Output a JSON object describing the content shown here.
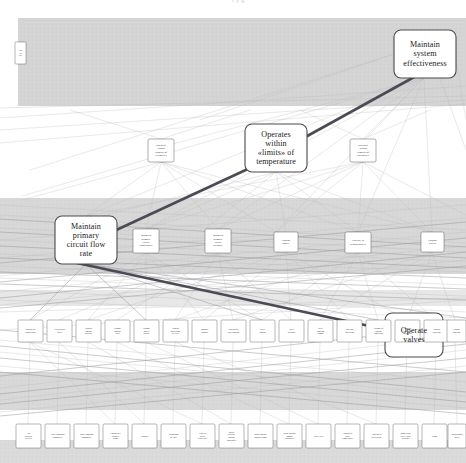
{
  "header": {
    "clipped_text": "t                    y                    g"
  },
  "diagram": {
    "title_visible": false,
    "colors": {
      "band_fill": "#d2d2d2",
      "node_fill": "#ffffff",
      "node_stroke": "#4a4a4a",
      "edge_faint": "#b9b9bd",
      "edge_mid": "#8d8d92",
      "highlight_edge": "#4b4b55",
      "text": "#1a1a1a",
      "background": "#ffffff"
    },
    "bands": [
      {
        "name": "band-top",
        "y": 18,
        "height": 88
      },
      {
        "name": "band-second",
        "y": 198,
        "height": 76
      },
      {
        "name": "band-third",
        "y": 290,
        "height": 16
      },
      {
        "name": "band-fourth",
        "y": 372,
        "height": 38
      },
      {
        "name": "band-bottom",
        "y": 440,
        "height": 23
      }
    ],
    "highlight_path": [
      "maintain-system-effectiveness",
      "operates-within-limits-of-temperature",
      "maintain-primary-circuit-flow-rate",
      "operate-valves"
    ],
    "major_nodes": [
      {
        "id": "maintain-system-effectiveness",
        "label": "Maintain system effectiveness",
        "lines": [
          "Maintain",
          "system",
          "effectiveness"
        ],
        "x": 394,
        "y": 30,
        "w": 62,
        "h": 48,
        "tier": "major"
      },
      {
        "id": "operates-within-limits-of-temperature",
        "label": "Operates within «limits» of temperature",
        "lines": [
          "Operates",
          "within",
          "«limits» of",
          "temperature"
        ],
        "x": 245,
        "y": 124,
        "w": 62,
        "h": 48,
        "tier": "major"
      },
      {
        "id": "maintain-primary-circuit-flow-rate",
        "label": "Maintain primary circuit flow rate",
        "lines": [
          "Maintain",
          "primary",
          "circuit flow",
          "rate"
        ],
        "x": 55,
        "y": 216,
        "w": 62,
        "h": 48,
        "tier": "major"
      },
      {
        "id": "operate-valves",
        "label": "Operate valves",
        "lines": [
          "Operate",
          "valves"
        ],
        "x": 385,
        "y": 313,
        "w": 58,
        "h": 44,
        "tier": "major"
      }
    ],
    "edge_nodes": [
      {
        "id": "left-edge-clipped-node",
        "label": "Ma int ain",
        "lines": [
          "Ma",
          "int",
          "ain"
        ],
        "x": 15,
        "y": 42,
        "w": 11,
        "h": 22,
        "tier": "tiny"
      }
    ],
    "tier2_nodes": [
      {
        "id": "t2-limits-left",
        "label": "Operates within «limits» of «velocity»",
        "lines": [
          "Operates",
          "within",
          "«limits» of",
          "«velocity»"
        ],
        "x": 148,
        "y": 139,
        "w": 26,
        "h": 23,
        "tier": "mid"
      },
      {
        "id": "t2-limits-right",
        "label": "Operates within «limits» of «pressure»",
        "lines": [
          "Operates",
          "within",
          "«limits» of",
          "«pressure»"
        ],
        "x": 350,
        "y": 139,
        "w": 26,
        "h": 23,
        "tier": "mid"
      }
    ],
    "tier3_nodes": [
      {
        "id": "t3-maintain-primary-circuit-temperature",
        "label": "Maintain primary circuit temperature",
        "lines": [
          "Maintain",
          "primary",
          "circuit",
          "temperature"
        ],
        "x": 133,
        "y": 229,
        "w": 26,
        "h": 24,
        "tier": "mid"
      },
      {
        "id": "t3-maintain-primary-circuit-pressure",
        "label": "Maintain primary circuit pressure",
        "lines": [
          "Maintain",
          "primary",
          "circuit",
          "pressure"
        ],
        "x": 205,
        "y": 229,
        "w": 26,
        "h": 24,
        "tier": "mid"
      },
      {
        "id": "t3-control-power",
        "label": "Control power",
        "lines": [
          "Control",
          "power"
        ],
        "x": 274,
        "y": 232,
        "w": 24,
        "h": 20,
        "tier": "mid"
      },
      {
        "id": "t3-operate-in-temperature",
        "label": "Operate in «temperature»",
        "lines": [
          "Operate in",
          "«temperature»"
        ],
        "x": 345,
        "y": 232,
        "w": 26,
        "h": 21,
        "tier": "mid"
      },
      {
        "id": "t3-control-valves",
        "label": "Control valves",
        "lines": [
          "Control",
          "valves"
        ],
        "x": 421,
        "y": 232,
        "w": 23,
        "h": 20,
        "tier": "mid"
      }
    ],
    "tier4_nodes": [
      {
        "id": "t4-01",
        "label": "Control the temperature",
        "lines": [
          "Control the",
          "temperature"
        ],
        "x": 18,
        "y": 320,
        "w": 25,
        "h": 22
      },
      {
        "id": "t4-02",
        "label": "Circulating water",
        "lines": [
          "Circulating",
          "water"
        ],
        "x": 47,
        "y": 320,
        "w": 25,
        "h": 22
      },
      {
        "id": "t4-03",
        "label": "Control coolant pressure",
        "lines": [
          "Control",
          "coolant",
          "pressure"
        ],
        "x": 76,
        "y": 320,
        "w": 25,
        "h": 22
      },
      {
        "id": "t4-04",
        "label": "Change coolant flow",
        "lines": [
          "Change",
          "coolant",
          "flow"
        ],
        "x": 105,
        "y": 320,
        "w": 25,
        "h": 22
      },
      {
        "id": "t4-05",
        "label": "Change power output",
        "lines": [
          "Change",
          "power",
          "output"
        ],
        "x": 134,
        "y": 320,
        "w": 25,
        "h": 22
      },
      {
        "id": "t4-06",
        "label": "Control measuring devices",
        "lines": [
          "Control",
          "measuring",
          "devices"
        ],
        "x": 163,
        "y": 320,
        "w": 25,
        "h": 22
      },
      {
        "id": "t4-07",
        "label": "Monitor coolant",
        "lines": [
          "Monitor",
          "coolant"
        ],
        "x": 192,
        "y": 320,
        "w": 25,
        "h": 22
      },
      {
        "id": "t4-08",
        "label": "Emergency core cooling",
        "lines": [
          "Emergency",
          "core cooling"
        ],
        "x": 221,
        "y": 320,
        "w": 25,
        "h": 22
      },
      {
        "id": "t4-09",
        "label": "Valve control",
        "lines": [
          "Valve",
          "control"
        ],
        "x": 250,
        "y": 320,
        "w": 25,
        "h": 22
      },
      {
        "id": "t4-10",
        "label": "Valve actuator",
        "lines": [
          "Valve",
          "actuator"
        ],
        "x": 279,
        "y": 320,
        "w": 25,
        "h": 22
      },
      {
        "id": "t4-11",
        "label": "Valve position sensor",
        "lines": [
          "Valve",
          "position",
          "sensor"
        ],
        "x": 308,
        "y": 320,
        "w": 25,
        "h": 22
      },
      {
        "id": "t4-12",
        "label": "Position indication",
        "lines": [
          "Position",
          "indication"
        ],
        "x": 337,
        "y": 320,
        "w": 25,
        "h": 22
      },
      {
        "id": "t4-13",
        "label": "Change of coolant condition",
        "lines": [
          "Change of",
          "coolant",
          "condition"
        ],
        "x": 366,
        "y": 320,
        "w": 25,
        "h": 22
      },
      {
        "id": "t4-14",
        "label": "Coolant sensor in boundary",
        "lines": [
          "Coolant",
          "sensor in",
          "boundary"
        ],
        "x": 395,
        "y": 320,
        "w": 25,
        "h": 22
      },
      {
        "id": "t4-15",
        "label": "Coolant isolation",
        "lines": [
          "Coolant",
          "isolation"
        ],
        "x": 424,
        "y": 320,
        "w": 25,
        "h": 22
      },
      {
        "id": "t4-16",
        "label": "Change position",
        "lines": [
          "Change",
          "position"
        ],
        "x": 447,
        "y": 320,
        "w": 19,
        "h": 22
      }
    ],
    "tier5_nodes": [
      {
        "id": "t5-01",
        "label": "Trip pressure devices",
        "lines": [
          "Trip",
          "pressure",
          "devices"
        ],
        "x": 16,
        "y": 424,
        "w": 25,
        "h": 24
      },
      {
        "id": "t5-02",
        "label": "Flow changing transmitter",
        "lines": [
          "Flow changing",
          "transmitter"
        ],
        "x": 45,
        "y": 424,
        "w": 25,
        "h": 24
      },
      {
        "id": "t5-03",
        "label": "Flow changing transmitter 2",
        "lines": [
          "Flow changing",
          "transmitter"
        ],
        "x": 74,
        "y": 424,
        "w": 25,
        "h": 24
      },
      {
        "id": "t5-04",
        "label": "Emergency drained pump",
        "lines": [
          "Emergency",
          "drained",
          "pump"
        ],
        "x": 103,
        "y": 424,
        "w": 25,
        "h": 24
      },
      {
        "id": "t5-05",
        "label": "Control",
        "lines": [
          "Control"
        ],
        "x": 132,
        "y": 424,
        "w": 25,
        "h": 24
      },
      {
        "id": "t5-06",
        "label": "Formation of flow",
        "lines": [
          "Formation",
          "of flow"
        ],
        "x": 161,
        "y": 424,
        "w": 25,
        "h": 24
      },
      {
        "id": "t5-07",
        "label": "Flow in direct value pipe",
        "lines": [
          "Flow in",
          "direct",
          "value pipe"
        ],
        "x": 190,
        "y": 424,
        "w": 25,
        "h": 24
      },
      {
        "id": "t5-08",
        "label": "Main reactor coolant continuity",
        "lines": [
          "Main",
          "reactor",
          "coolant",
          "continuity"
        ],
        "x": 219,
        "y": 424,
        "w": 25,
        "h": 24
      },
      {
        "id": "t5-09",
        "label": "Main coolant control pump",
        "lines": [
          "Main coolant",
          "control pump"
        ],
        "x": 248,
        "y": 424,
        "w": 25,
        "h": 24
      },
      {
        "id": "t5-10",
        "label": "Main coolant pumps continuity",
        "lines": [
          "Main coolant",
          "pumps",
          "continuity"
        ],
        "x": 277,
        "y": 424,
        "w": 25,
        "h": 24
      },
      {
        "id": "t5-11",
        "label": "Valve seal",
        "lines": [
          "Valve seal"
        ],
        "x": 306,
        "y": 424,
        "w": 25,
        "h": 24
      },
      {
        "id": "t5-12",
        "label": "Control of valve temperature",
        "lines": [
          "Control of",
          "valve",
          "temperature"
        ],
        "x": 335,
        "y": 424,
        "w": 25,
        "h": 24
      },
      {
        "id": "t5-13",
        "label": "Coolant in the reactor",
        "lines": [
          "Coolant in",
          "the reactor"
        ],
        "x": 364,
        "y": 424,
        "w": 25,
        "h": 24
      },
      {
        "id": "t5-14",
        "label": "Immersion valve flow actuator",
        "lines": [
          "Immersion",
          "valve flow",
          "actuator"
        ],
        "x": 393,
        "y": 424,
        "w": 25,
        "h": 24
      },
      {
        "id": "t5-15",
        "label": "Pump",
        "lines": [
          "Pump"
        ],
        "x": 422,
        "y": 424,
        "w": 25,
        "h": 24
      },
      {
        "id": "t5-16",
        "label": "Dimensional index",
        "lines": [
          "Dimensional",
          "index"
        ],
        "x": 448,
        "y": 424,
        "w": 18,
        "h": 24
      }
    ]
  }
}
